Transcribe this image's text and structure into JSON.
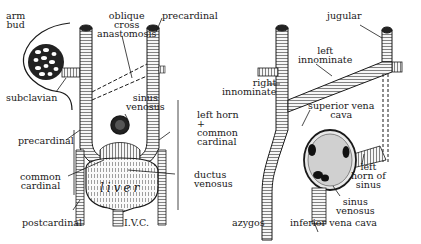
{
  "diagram": {
    "panels": [
      {
        "id": "left",
        "labels": {
          "arm_bud": "arm\nbud",
          "oblique": "oblique\ncross\nanastomosis",
          "precardinal_top": "precardinal",
          "subclavian": "subclavian",
          "sinus_venosus": "sinus\nvenosus",
          "left_horn": "left horn\n+\ncommon\ncardinal",
          "precardinal_side": "precardinal",
          "common_cardinal": "common\ncardinal",
          "ductus_venosus": "ductus\nvenosus",
          "liver": "l i v e r",
          "postcardinal": "postcardinal",
          "ivc": "I.V.C."
        }
      },
      {
        "id": "right",
        "labels": {
          "jugular": "jugular",
          "left_innominate": "left\ninnominate",
          "right_innominate": "right\ninnominate",
          "superior_vena_cava": "superior vena\ncava",
          "left_horn_of_sinus": "left\nhorn of\nsinus",
          "sinus_venosus": "sinus\nvenosus",
          "azygos": "azygos",
          "inferior_vena_cava": "inferior vena cava"
        }
      }
    ],
    "colors": {
      "ink": "#1a1a1a",
      "background": "#ffffff",
      "vessel_fill": "#f4f4f4",
      "dark_lumen": "#111111"
    }
  }
}
